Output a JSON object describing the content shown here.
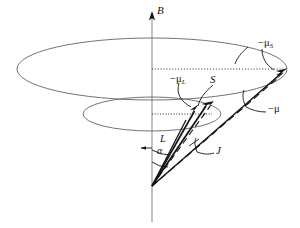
{
  "figure": {
    "background": "#ffffff",
    "stroke_color": "#1a1a1a",
    "ellipse_color": "#5a5a5a",
    "dotted_color": "#3a3a3a",
    "width": 300,
    "height": 228
  },
  "axis": {
    "name": "B",
    "label": "B",
    "x": 152,
    "top_y": 12,
    "bottom_y": 222
  },
  "origin": {
    "x": 152,
    "y": 186
  },
  "vectors": [
    {
      "name": "L",
      "label": "L",
      "style": "solid",
      "from": {
        "x": 152,
        "y": 186
      },
      "to": {
        "x": 200,
        "y": 108
      },
      "arrow": true
    },
    {
      "name": "S",
      "label": "S",
      "style": "solid",
      "from": {
        "x": 152,
        "y": 186
      },
      "to": {
        "x": 189,
        "y": 112
      },
      "arrow": true
    },
    {
      "name": "J",
      "label": "J",
      "style": "dashed",
      "from": {
        "x": 152,
        "y": 186
      },
      "to": {
        "x": 214,
        "y": 101
      },
      "arrow": true
    },
    {
      "name": "minus-mu-S",
      "label": "-μS",
      "label_base": "−μ",
      "label_sub": "S",
      "style": "solid",
      "from": {
        "x": 152,
        "y": 186
      },
      "to": {
        "x": 286,
        "y": 70
      },
      "arrow": true
    },
    {
      "name": "minus-mu-L",
      "label": "-μL",
      "label_base": "−μ",
      "label_sub": "L",
      "style": "solid",
      "from": {
        "x": 152,
        "y": 186
      },
      "to": {
        "x": 198,
        "y": 105
      },
      "arrow": true
    },
    {
      "name": "minus-mu",
      "label": "-μ",
      "label_base": "−μ",
      "label_sub": "",
      "style": "dashed",
      "from": {
        "x": 152,
        "y": 186
      },
      "to": {
        "x": 283,
        "y": 74
      },
      "arrow": true
    }
  ],
  "labels": {
    "B": "B",
    "S": "S",
    "L": "L",
    "J": "J",
    "alpha": "α",
    "minus_mu_S_base": "−μ",
    "minus_mu_S_sub": "S",
    "minus_mu_L_base": "−μ",
    "minus_mu_L_sub": "L",
    "minus_mu_base": "−μ"
  },
  "cones": [
    {
      "name": "outer-precession-cone",
      "cx": 152,
      "cy": 69,
      "rx": 135,
      "ry": 31
    },
    {
      "name": "inner-precession-cone",
      "cx": 152,
      "cy": 114,
      "rx": 69,
      "ry": 17
    }
  ],
  "dotted_lines": [
    {
      "name": "outer-radius-dotted",
      "x1": 152,
      "y1": 69,
      "x2": 286,
      "y2": 69
    },
    {
      "name": "inner-radius-dotted",
      "x1": 152,
      "y1": 114,
      "x2": 212,
      "y2": 114
    }
  ],
  "angles": [
    {
      "name": "alpha-angle",
      "label": "α"
    },
    {
      "name": "L-angle",
      "label": "L"
    },
    {
      "name": "J-angle",
      "label": "J"
    }
  ]
}
